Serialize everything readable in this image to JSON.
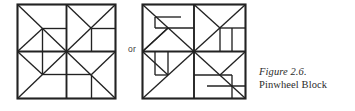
{
  "figure": {
    "connector_label": "or",
    "caption_title": "Figure 2.6.",
    "caption_subtitle": "Pinwheel Block",
    "stroke_color": "#222222",
    "fill_color": "#ffffff",
    "background_color": "#ffffff"
  },
  "diagram_data": {
    "type": "diagram",
    "subject": "quilt block piecing diagrams",
    "variant_count": 2,
    "grid": "2x2 quadrants, each quadrant subdivided into triangles and rectangles",
    "symmetry": "4-fold rotational (pinwheel)",
    "blocks": [
      {
        "name": "pinwheel-block-variant-a",
        "label": "Pinwheel Block variant A",
        "outer_border": true,
        "quadrants": 4,
        "quadrant_size": 48,
        "pieces_per_quadrant": 4,
        "description": "Each quadrant holds one large half-square triangle on the diagonal toward the block center, a smaller triangle, and two rectangular bars forming the pinwheel vane."
      },
      {
        "name": "pinwheel-block-variant-b",
        "label": "Pinwheel Block variant B",
        "outer_border": true,
        "quadrants": 4,
        "quadrant_size": 50,
        "pieces_per_quadrant": 4,
        "description": "Mirror-variant piecing: large half-square triangle with the bar unit rotated so the vanes spin in the opposite arrangement."
      }
    ]
  }
}
